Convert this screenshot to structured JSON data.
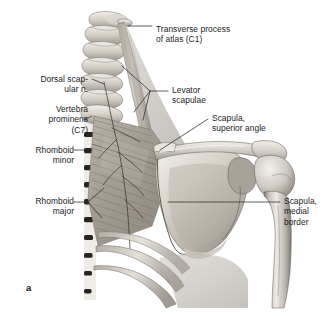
{
  "figure": {
    "letter": "a",
    "background_color": "#ffffff",
    "label_color": "#1b1b1b",
    "leader_color": "#2b2b2b"
  },
  "labels": [
    {
      "name": "transverse-process-of-atlas",
      "lines": [
        "Transverse process",
        "of atlas (C1)"
      ],
      "text": "Transverse process\nof atlas (C1)",
      "align": "left",
      "x": 156,
      "y": 24
    },
    {
      "name": "dorsal-scapular-nerve",
      "lines": [
        "Dorsal scap-",
        "ular n."
      ],
      "text": "Dorsal scap-\nular n.",
      "align": "right",
      "x": 18,
      "y": 74
    },
    {
      "name": "levator-scapulae",
      "lines": [
        "Levator",
        "scapulae"
      ],
      "text": "Levator\nscapulae",
      "align": "left",
      "x": 172,
      "y": 85
    },
    {
      "name": "vertebra-prominens",
      "lines": [
        "Vertebra",
        "prominens",
        "(C7)"
      ],
      "text": "Vertebra\nprominens\n(C7)",
      "align": "right",
      "x": 18,
      "y": 104
    },
    {
      "name": "scapula-superior-angle",
      "lines": [
        "Scapula,",
        "superior angle"
      ],
      "text": "Scapula,\nsuperior angle",
      "align": "left",
      "x": 212,
      "y": 113
    },
    {
      "name": "rhomboid-minor",
      "lines": [
        "Rhomboid",
        "minor"
      ],
      "text": "Rhomboid\nminor",
      "align": "right",
      "x": 18,
      "y": 145
    },
    {
      "name": "rhomboid-major",
      "lines": [
        "Rhomboid",
        "major"
      ],
      "text": "Rhomboid\nmajor",
      "align": "right",
      "x": 18,
      "y": 196
    },
    {
      "name": "scapula-medial-border",
      "lines": [
        "Scapula,",
        "medial",
        "border"
      ],
      "text": "Scapula,\nmedial\nborder",
      "align": "left",
      "x": 284,
      "y": 196
    }
  ],
  "structures": [
    "cervical-vertebrae",
    "atlas-transverse-process",
    "levator-scapulae-muscle",
    "rhomboid-minor-muscle",
    "rhomboid-major-muscle",
    "dorsal-scapular-nerve",
    "scapula",
    "scapular-spine",
    "acromion",
    "humerus",
    "ribs"
  ]
}
